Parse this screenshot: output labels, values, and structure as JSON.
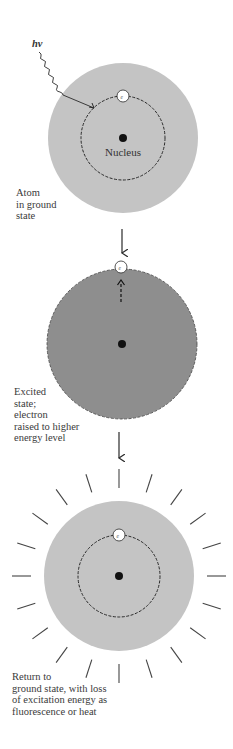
{
  "diagram": {
    "photon_label": "hν",
    "stages": [
      {
        "id": "ground",
        "caption": "Atom\nin ground\nstate",
        "nucleus_label": "Nucleus",
        "electron_label": "e⁻",
        "fill": "#c4c4c4"
      },
      {
        "id": "excited",
        "caption": "Excited\nstate;\nelectron\nraised to higher\nenergy level",
        "electron_label": "e⁻",
        "fill": "#8e8e8e"
      },
      {
        "id": "return",
        "caption": "Return to\nground state, with loss\nof excitation energy as\nfluorescence or heat",
        "electron_label": "e⁻",
        "fill": "#c4c4c4"
      }
    ],
    "colors": {
      "line": "#2a2a2a",
      "nucleus": "#111111",
      "electron_fill": "#ffffff"
    }
  }
}
